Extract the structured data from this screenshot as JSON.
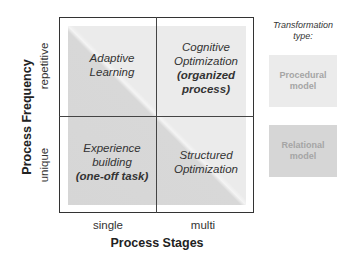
{
  "diagram": {
    "x_axis": {
      "title": "Process Stages",
      "ticks": [
        "single",
        "multi"
      ]
    },
    "y_axis": {
      "title": "Process Frequency",
      "ticks": [
        "repetitive",
        "unique"
      ]
    },
    "quadrants": {
      "top_left": {
        "line1": "Adaptive",
        "line2": "Learning",
        "emphasis": ""
      },
      "top_right": {
        "line1": "Cognitive",
        "line2": "Optimization",
        "emphasis": "(organized process)"
      },
      "bottom_left": {
        "line1": "Experience",
        "line2": "building",
        "emphasis": "(one-off task)"
      },
      "bottom_right": {
        "line1": "Structured",
        "line2": "Optimization",
        "emphasis": ""
      }
    },
    "legend": {
      "title": "Transformation type:",
      "items": [
        {
          "label": "Procedural model",
          "color": "#ebebeb"
        },
        {
          "label": "Relational model",
          "color": "#d6d6d6"
        }
      ]
    },
    "colors": {
      "relational": "#d6d6d6",
      "procedural": "#ebebeb",
      "frame": "#333333"
    }
  }
}
